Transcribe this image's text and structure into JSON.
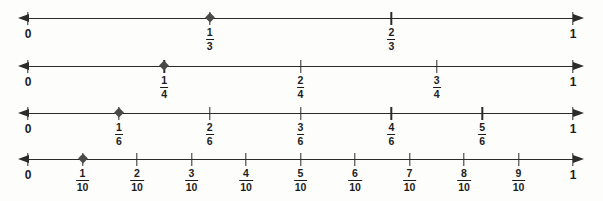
{
  "figure": {
    "background_color": "#fdfdfc",
    "line_color": "#2b2b2b",
    "marker_color": "#4a4a4a",
    "text_color": "#1c1c1c"
  },
  "chart_data": {
    "type": "line",
    "xlabel": "",
    "ylabel": "",
    "xlim": [
      0,
      1
    ],
    "grid": false,
    "legend": "none",
    "series": [
      {
        "name": "thirds",
        "denominator": 3,
        "start_label": "0",
        "end_label": "1",
        "marked_value": "1/3",
        "ticks": [
          {
            "value": 0,
            "label": "0",
            "type": "whole",
            "marker": "none"
          },
          {
            "numerator": 1,
            "denominator": 3,
            "label": "1/3",
            "type": "fraction",
            "marker": "diamond"
          },
          {
            "numerator": 2,
            "denominator": 3,
            "label": "2/3",
            "type": "fraction",
            "marker": "none"
          },
          {
            "value": 1,
            "label": "1",
            "type": "whole",
            "marker": "none"
          }
        ]
      },
      {
        "name": "fourths",
        "denominator": 4,
        "start_label": "0",
        "end_label": "1",
        "marked_value": "1/4",
        "ticks": [
          {
            "value": 0,
            "label": "0",
            "type": "whole",
            "marker": "none"
          },
          {
            "numerator": 1,
            "denominator": 4,
            "label": "1/4",
            "type": "fraction",
            "marker": "diamond"
          },
          {
            "numerator": 2,
            "denominator": 4,
            "label": "2/4",
            "type": "fraction",
            "marker": "none"
          },
          {
            "numerator": 3,
            "denominator": 4,
            "label": "3/4",
            "type": "fraction",
            "marker": "none"
          },
          {
            "value": 1,
            "label": "1",
            "type": "whole",
            "marker": "none"
          }
        ]
      },
      {
        "name": "sixths",
        "denominator": 6,
        "start_label": "0",
        "end_label": "1",
        "marked_value": "1/6",
        "ticks": [
          {
            "value": 0,
            "label": "0",
            "type": "whole",
            "marker": "none"
          },
          {
            "numerator": 1,
            "denominator": 6,
            "label": "1/6",
            "type": "fraction",
            "marker": "diamond"
          },
          {
            "numerator": 2,
            "denominator": 6,
            "label": "2/6",
            "type": "fraction",
            "marker": "none"
          },
          {
            "numerator": 3,
            "denominator": 6,
            "label": "3/6",
            "type": "fraction",
            "marker": "none"
          },
          {
            "numerator": 4,
            "denominator": 6,
            "label": "4/6",
            "type": "fraction",
            "marker": "none"
          },
          {
            "numerator": 5,
            "denominator": 6,
            "label": "5/6",
            "type": "fraction",
            "marker": "none"
          },
          {
            "value": 1,
            "label": "1",
            "type": "whole",
            "marker": "none"
          }
        ]
      },
      {
        "name": "tenths",
        "denominator": 10,
        "start_label": "0",
        "end_label": "1",
        "marked_value": "1/10",
        "ticks": [
          {
            "value": 0,
            "label": "0",
            "type": "whole",
            "marker": "none"
          },
          {
            "numerator": 1,
            "denominator": 10,
            "label": "1/10",
            "type": "fraction",
            "marker": "diamond"
          },
          {
            "numerator": 2,
            "denominator": 10,
            "label": "2/10",
            "type": "fraction",
            "marker": "none"
          },
          {
            "numerator": 3,
            "denominator": 10,
            "label": "3/10",
            "type": "fraction",
            "marker": "none"
          },
          {
            "numerator": 4,
            "denominator": 10,
            "label": "4/10",
            "type": "fraction",
            "marker": "none"
          },
          {
            "numerator": 5,
            "denominator": 10,
            "label": "5/10",
            "type": "fraction",
            "marker": "none"
          },
          {
            "numerator": 6,
            "denominator": 10,
            "label": "6/10",
            "type": "fraction",
            "marker": "none"
          },
          {
            "numerator": 7,
            "denominator": 10,
            "label": "7/10",
            "type": "fraction",
            "marker": "none"
          },
          {
            "numerator": 8,
            "denominator": 10,
            "label": "8/10",
            "type": "fraction",
            "marker": "none"
          },
          {
            "numerator": 9,
            "denominator": 10,
            "label": "9/10",
            "type": "fraction",
            "marker": "none"
          },
          {
            "value": 1,
            "label": "1",
            "type": "whole",
            "marker": "none"
          }
        ]
      }
    ]
  }
}
